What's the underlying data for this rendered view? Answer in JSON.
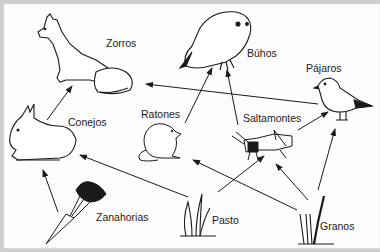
{
  "diagram": {
    "nodes": [
      {
        "id": "zorros",
        "label": "Zorros"
      },
      {
        "id": "buhos",
        "label": "Búhos"
      },
      {
        "id": "pajaros",
        "label": "Pájaros"
      },
      {
        "id": "conejos",
        "label": "Conejos"
      },
      {
        "id": "ratones",
        "label": "Ratones"
      },
      {
        "id": "saltamontes",
        "label": "Saltamontes"
      },
      {
        "id": "zanahorias",
        "label": "Zanahorias"
      },
      {
        "id": "pasto",
        "label": "Pasto"
      },
      {
        "id": "granos",
        "label": "Granos"
      }
    ],
    "edges": [
      {
        "from": "conejos",
        "to": "zorros"
      },
      {
        "from": "pajaros",
        "to": "zorros"
      },
      {
        "from": "ratones",
        "to": "buhos"
      },
      {
        "from": "saltamontes",
        "to": "buhos"
      },
      {
        "from": "saltamontes",
        "to": "pajaros"
      },
      {
        "from": "granos",
        "to": "pajaros"
      },
      {
        "from": "zanahorias",
        "to": "conejos"
      },
      {
        "from": "pasto",
        "to": "conejos"
      },
      {
        "from": "pasto",
        "to": "saltamontes"
      },
      {
        "from": "granos",
        "to": "saltamontes"
      },
      {
        "from": "granos",
        "to": "ratones"
      }
    ],
    "colors": {
      "line": "#1a1a1a",
      "background": "#fdfdfd",
      "border": "#cfcfcf"
    }
  }
}
